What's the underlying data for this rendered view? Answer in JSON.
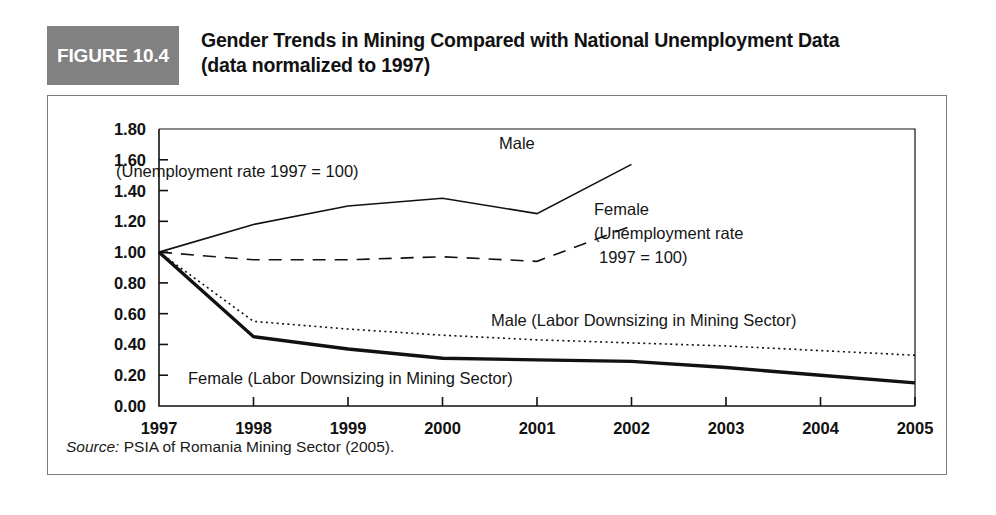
{
  "figure": {
    "tag": "FIGURE 10.4",
    "title_line1": "Gender Trends in Mining Compared with National Unemployment Data",
    "title_line2": "(data normalized to 1997)",
    "source_prefix": "Source:",
    "source_text": " PSIA of Romania Mining Sector (2005)."
  },
  "colors": {
    "tag_background": "#818181",
    "tag_text": "#ffffff",
    "line": "#111111",
    "frame": "#7b7b7b",
    "axis": "#111111"
  },
  "annotations": {
    "male_unemployment_l1": "Male",
    "male_unemployment_l2": "(Unemployment rate 1997 = 100)",
    "female_unemployment_l1": "Female",
    "female_unemployment_l2": "(Unemployment rate",
    "female_unemployment_l3": "1997 = 100)",
    "male_downsizing": "Male (Labor Downsizing in Mining Sector)",
    "female_downsizing": "Female (Labor Downsizing in Mining Sector)"
  },
  "chart_data": {
    "type": "line",
    "title": "Gender Trends in Mining Compared with National Unemployment Data (data normalized to 1997)",
    "subtitle": "(data normalized to 1997)",
    "xlabel": "",
    "ylabel": "",
    "x": [
      1997,
      1998,
      1999,
      2000,
      2001,
      2002,
      2003,
      2004,
      2005
    ],
    "xtick_labels": [
      "1997",
      "1998",
      "1999",
      "2000",
      "2001",
      "2002",
      "2003",
      "2004",
      "2005"
    ],
    "ytick_labels": [
      "0.00",
      "0.20",
      "0.40",
      "0.60",
      "0.80",
      "1.00",
      "1.20",
      "1.40",
      "1.60",
      "1.80"
    ],
    "ylim": [
      0.0,
      1.8
    ],
    "ytick_step": 0.2,
    "grid": false,
    "legend_position": "inline-annotations",
    "series": [
      {
        "name": "Male (Unemployment rate 1997 = 100)",
        "style": "solid",
        "width": 1.6,
        "x": [
          1997,
          1998,
          1999,
          2000,
          2001,
          2002
        ],
        "values": [
          1.0,
          1.18,
          1.3,
          1.35,
          1.25,
          1.57
        ]
      },
      {
        "name": "Female (Unemployment rate 1997 = 100)",
        "style": "dashed",
        "width": 1.6,
        "x": [
          1997,
          1998,
          1999,
          2000,
          2001,
          2002
        ],
        "values": [
          1.0,
          0.95,
          0.95,
          0.97,
          0.94,
          1.17
        ]
      },
      {
        "name": "Male (Labor Downsizing in Mining Sector)",
        "style": "dotted",
        "width": 1.6,
        "x": [
          1997,
          1998,
          1999,
          2000,
          2001,
          2002,
          2003,
          2004,
          2005
        ],
        "values": [
          1.0,
          0.55,
          0.5,
          0.46,
          0.43,
          0.41,
          0.39,
          0.36,
          0.33
        ]
      },
      {
        "name": "Female (Labor Downsizing in Mining Sector)",
        "style": "solid-thick",
        "width": 3.4,
        "x": [
          1997,
          1998,
          1999,
          2000,
          2001,
          2002,
          2003,
          2004,
          2005
        ],
        "values": [
          1.0,
          0.45,
          0.37,
          0.31,
          0.3,
          0.29,
          0.25,
          0.2,
          0.15
        ]
      }
    ]
  }
}
